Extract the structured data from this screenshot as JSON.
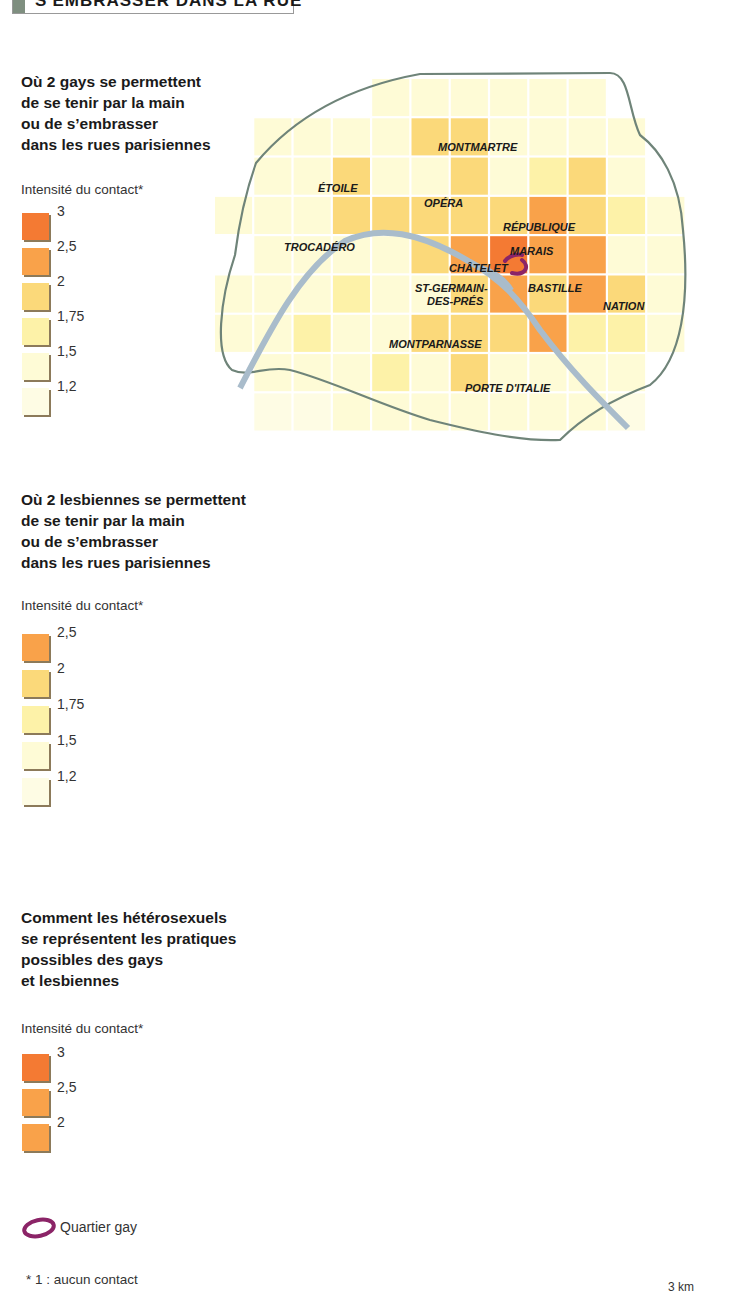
{
  "header": {
    "title": "S'EMBRASSER DANS LA RUE"
  },
  "colors": {
    "levels": [
      "#ffffff",
      "#fefbd6",
      "#fdf2a8",
      "#fbd97a",
      "#f9a24a",
      "#f47a33"
    ],
    "boundary": "#6f8479",
    "seine": "#a9bccb",
    "gay_quarter": "#8b2467"
  },
  "maps": [
    {
      "title": [
        "Où 2 gays se permettent",
        "de se tenir par la main",
        "ou de s’embrasser",
        "dans les rues parisiennes"
      ],
      "legend_heading": "Intensité du contact*",
      "legend": [
        {
          "level": 5,
          "label": "3"
        },
        {
          "level": 4,
          "label": "2,5"
        },
        {
          "level": 3,
          "label": "2"
        },
        {
          "level": 2,
          "label": "1,75"
        },
        {
          "level": 1,
          "label": "1,5"
        },
        {
          "level": 0,
          "label": "1,2"
        }
      ],
      "legend_labels_top": [
        "3",
        "2,5",
        "2",
        "1,75",
        "1,5",
        "1,2"
      ],
      "grid": [
        [
          0,
          0,
          0,
          0,
          1,
          1,
          1,
          1,
          1,
          1,
          0,
          0
        ],
        [
          0,
          1,
          1,
          1,
          1,
          3,
          3,
          1,
          1,
          1,
          1,
          0
        ],
        [
          0,
          1,
          1,
          3,
          1,
          1,
          3,
          1,
          2,
          3,
          1,
          0
        ],
        [
          1,
          1,
          1,
          3,
          3,
          3,
          3,
          3,
          4,
          3,
          2,
          1
        ],
        [
          0,
          1,
          1,
          1,
          1,
          3,
          4,
          5,
          4,
          4,
          1,
          1
        ],
        [
          1,
          1,
          1,
          2,
          1,
          1,
          3,
          4,
          3,
          4,
          3,
          1
        ],
        [
          1,
          1,
          2,
          1,
          1,
          3,
          3,
          3,
          4,
          2,
          2,
          1
        ],
        [
          0,
          1,
          1,
          1,
          2,
          1,
          3,
          1,
          1,
          1,
          1,
          0
        ],
        [
          0,
          0,
          0,
          1,
          1,
          1,
          1,
          1,
          1,
          1,
          0,
          0
        ],
        [
          0,
          0,
          0,
          0,
          0,
          0,
          0,
          0,
          0,
          0,
          0,
          0
        ]
      ],
      "places": [
        {
          "name": "MONTMARTRE",
          "x": 438,
          "y": 151
        },
        {
          "name": "ÉTOILE",
          "x": 318,
          "y": 192
        },
        {
          "name": "OPÉRA",
          "x": 424,
          "y": 207
        },
        {
          "name": "RÉPUBLIQUE",
          "x": 503,
          "y": 231
        },
        {
          "name": "TROCADÉRO",
          "x": 284,
          "y": 251
        },
        {
          "name": "MARAIS",
          "x": 510,
          "y": 255
        },
        {
          "name": "CHÂTELET",
          "x": 449,
          "y": 272
        },
        {
          "name": "ST-GERMAIN-",
          "x": 415,
          "y": 292
        },
        {
          "name": "DES-PRÉS",
          "x": 427,
          "y": 305
        },
        {
          "name": "BASTILLE",
          "x": 528,
          "y": 292
        },
        {
          "name": "NATION",
          "x": 603,
          "y": 310
        },
        {
          "name": "MONTPARNASSE",
          "x": 389,
          "y": 348
        },
        {
          "name": "PORTE D'ITALIE",
          "x": 465,
          "y": 392
        }
      ],
      "gay_quarter_shape": "hook"
    },
    {
      "title": [
        "Où 2 lesbiennes se permettent",
        "de se tenir par la main",
        "ou de s’embrasser",
        "dans les rues parisiennes"
      ],
      "legend_heading": "Intensité du contact*",
      "legend": [
        {
          "level": 4,
          "label": "2,5"
        },
        {
          "level": 3,
          "label": "2"
        },
        {
          "level": 2,
          "label": "1,75"
        },
        {
          "level": 1,
          "label": "1,5"
        },
        {
          "level": 0,
          "label": "1,2"
        }
      ],
      "grid": [
        [
          0,
          0,
          0,
          0,
          1,
          1,
          1,
          1,
          1,
          1,
          0,
          0
        ],
        [
          0,
          1,
          1,
          1,
          1,
          1,
          1,
          1,
          1,
          2,
          1,
          0
        ],
        [
          0,
          1,
          1,
          1,
          2,
          2,
          2,
          2,
          2,
          2,
          1,
          0
        ],
        [
          1,
          1,
          1,
          2,
          2,
          2,
          2,
          3,
          3,
          2,
          2,
          1
        ],
        [
          0,
          1,
          2,
          2,
          1,
          2,
          3,
          4,
          3,
          2,
          2,
          1
        ],
        [
          1,
          1,
          1,
          1,
          2,
          2,
          3,
          3,
          3,
          2,
          1,
          1
        ],
        [
          0,
          1,
          1,
          1,
          2,
          2,
          2,
          2,
          1,
          1,
          1,
          1
        ],
        [
          0,
          1,
          1,
          1,
          1,
          1,
          1,
          1,
          1,
          1,
          1,
          1
        ],
        [
          0,
          0,
          0,
          1,
          1,
          1,
          1,
          1,
          1,
          1,
          0,
          0
        ],
        [
          0,
          0,
          0,
          0,
          0,
          0,
          0,
          0,
          0,
          0,
          0,
          0
        ]
      ],
      "places": [],
      "gay_quarter_shape": "ellipse"
    },
    {
      "title": [
        "Comment les hétérosexuels",
        "se représentent les pratiques",
        "possibles des gays",
        "et  lesbiennes"
      ],
      "legend_heading": "Intensité du contact*",
      "legend": [
        {
          "level": 5,
          "label": "3"
        },
        {
          "level": 4,
          "label": "2,5"
        },
        {
          "level": 0,
          "label": "2"
        }
      ],
      "grid": [
        [
          0,
          0,
          0,
          4,
          4,
          4,
          4,
          4,
          4,
          0,
          0,
          0
        ],
        [
          0,
          4,
          4,
          4,
          4,
          5,
          4,
          4,
          4,
          4,
          0,
          0
        ],
        [
          0,
          4,
          5,
          4,
          5,
          5,
          5,
          5,
          4,
          4,
          0,
          0
        ],
        [
          4,
          4,
          5,
          5,
          5,
          5,
          5,
          5,
          5,
          4,
          4,
          0
        ],
        [
          4,
          5,
          5,
          5,
          5,
          5,
          5,
          5,
          5,
          5,
          4,
          0
        ],
        [
          4,
          5,
          5,
          5,
          5,
          5,
          5,
          5,
          5,
          4,
          5,
          4
        ],
        [
          4,
          5,
          4,
          5,
          5,
          5,
          5,
          5,
          5,
          4,
          4,
          4
        ],
        [
          0,
          4,
          4,
          4,
          5,
          4,
          5,
          4,
          4,
          4,
          4,
          4
        ],
        [
          0,
          0,
          4,
          4,
          4,
          4,
          4,
          4,
          4,
          0,
          0,
          0
        ]
      ],
      "places": [],
      "gay_quarter_shape": "ellipse"
    }
  ],
  "footer": {
    "quartier_label": "Quartier gay",
    "note": "* 1 : aucun contact",
    "scale": "3 km"
  },
  "chart_data": [
    {
      "type": "heatmap",
      "title": "Où 2 gays se permettent de se tenir par la main ou de s’embrasser dans les rues parisiennes",
      "legend_title": "Intensité du contact*",
      "legend_breaks": [
        3,
        2.5,
        2,
        1.75,
        1.5,
        1.2
      ],
      "hotspots": [
        "MARAIS",
        "CHÂTELET",
        "RÉPUBLIQUE",
        "BASTILLE"
      ],
      "max_level": 3,
      "place_labels": [
        "MONTMARTRE",
        "ÉTOILE",
        "OPÉRA",
        "RÉPUBLIQUE",
        "TROCADÉRO",
        "MARAIS",
        "CHÂTELET",
        "ST-GERMAIN-DES-PRÉS",
        "BASTILLE",
        "NATION",
        "MONTPARNASSE",
        "PORTE D'ITALIE"
      ]
    },
    {
      "type": "heatmap",
      "title": "Où 2 lesbiennes se permettent de se tenir par la main ou de s’embrasser dans les rues parisiennes",
      "legend_title": "Intensité du contact*",
      "legend_breaks": [
        2.5,
        2,
        1.75,
        1.5,
        1.2
      ],
      "hotspots": [
        "Marais"
      ],
      "max_level": 2.5
    },
    {
      "type": "heatmap",
      "title": "Comment les hétérosexuels se représentent les pratiques possibles des gays et lesbiennes",
      "legend_title": "Intensité du contact*",
      "legend_breaks": [
        3,
        2.5,
        2
      ],
      "max_level": 3
    }
  ]
}
